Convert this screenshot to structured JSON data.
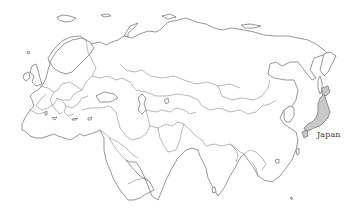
{
  "map": {
    "region": "Eurasia",
    "style": "outline",
    "highlighted_country": {
      "name": "Japan",
      "label": "Japan",
      "fill_color": "#c8c8c8"
    },
    "outline_color": "#6a6a6a",
    "background_color": "#ffffff"
  }
}
